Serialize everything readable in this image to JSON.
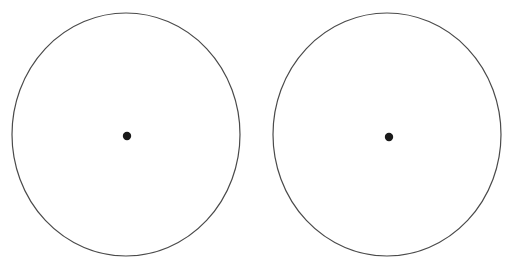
{
  "canvas": {
    "width": 518,
    "height": 267,
    "background_color": "#ffffff"
  },
  "figure": {
    "type": "geometric-figure",
    "shape_count": 2,
    "has_text": false,
    "has_axes": false,
    "has_legend": false
  },
  "style": {
    "outline_color": "#4a4a4a",
    "outline_width": 1.2,
    "dot_color": "#1a1a1a",
    "dot_radius": 4.2
  },
  "shapes": [
    {
      "id": "circle-left",
      "name": "left-circle",
      "cx": 126,
      "cy": 134.5,
      "rx": 114,
      "ry": 121.5,
      "dot": {
        "cx": 127,
        "cy": 136,
        "r": 4.2
      }
    },
    {
      "id": "circle-right",
      "name": "right-circle",
      "cx": 387,
      "cy": 134.5,
      "rx": 114,
      "ry": 121.5,
      "dot": {
        "cx": 389,
        "cy": 137,
        "r": 4.2
      }
    }
  ]
}
